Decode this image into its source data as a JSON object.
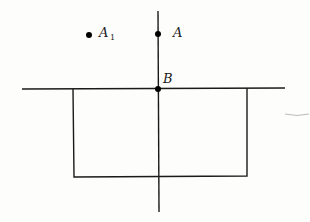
{
  "diagram": {
    "points": [
      {
        "name": "A",
        "x": 158,
        "y": 34
      },
      {
        "name": "A",
        "subscript": "1",
        "x": 89,
        "y": 34
      },
      {
        "name": "B",
        "x": 158,
        "y": 89
      }
    ],
    "labels": {
      "A": "A",
      "A1_main": "A",
      "A1_sub": "1",
      "B": "B"
    },
    "colors": {
      "line": "#1a1a1a",
      "background": "#fdfdfb"
    }
  }
}
